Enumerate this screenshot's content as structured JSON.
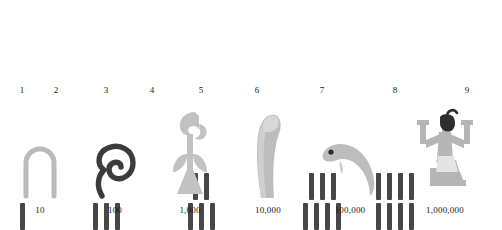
{
  "figure": {
    "colors": {
      "stroke_dark": "#474747",
      "sign_light": "#b9b9b9",
      "sign_mid": "#a8a8a8",
      "sign_dark": "#3b3b3b",
      "kilt_pale": "#e2e2e2",
      "background": "#ffffff",
      "text": "#1a1a1a"
    },
    "units_row": [
      {
        "label": "1",
        "x": 22,
        "top_strokes": 0,
        "bottom_strokes": 1,
        "glyph": "single-stroke"
      },
      {
        "label": "2",
        "x": 56,
        "top_strokes": 0,
        "bottom_strokes": 0,
        "glyph": "none"
      },
      {
        "label": "3",
        "x": 106,
        "top_strokes": 0,
        "bottom_strokes": 3,
        "glyph": "three-strokes"
      },
      {
        "label": "4",
        "x": 152,
        "top_strokes": 0,
        "bottom_strokes": 0,
        "glyph": "none"
      },
      {
        "label": "5",
        "x": 201,
        "top_strokes": 2,
        "bottom_strokes": 3,
        "glyph": "two-over-three-strokes"
      },
      {
        "label": "6",
        "x": 257,
        "top_strokes": 0,
        "bottom_strokes": 0,
        "glyph": "none"
      },
      {
        "label": "7",
        "x": 322,
        "top_strokes": 3,
        "bottom_strokes": 4,
        "glyph": "three-over-four-strokes"
      },
      {
        "label": "8",
        "x": 395,
        "top_strokes": 4,
        "bottom_strokes": 4,
        "glyph": "four-over-four-strokes"
      },
      {
        "label": "9",
        "x": 467,
        "top_strokes": 0,
        "bottom_strokes": 0,
        "glyph": "none"
      }
    ],
    "signs_row": [
      {
        "label": "10",
        "x": 40,
        "sign": "heel-bone-arch",
        "tone": "light"
      },
      {
        "label": "100",
        "x": 115,
        "sign": "coiled-rope",
        "tone": "dark"
      },
      {
        "label": "1,000",
        "x": 190,
        "sign": "lotus-plant",
        "tone": "light"
      },
      {
        "label": "10,000",
        "x": 268,
        "sign": "finger",
        "tone": "light"
      },
      {
        "label": "100,000",
        "x": 350,
        "sign": "tadpole",
        "tone": "mid"
      },
      {
        "label": "1,000,000",
        "x": 445,
        "sign": "kneeling-god-heh",
        "tone": "mid"
      }
    ]
  }
}
